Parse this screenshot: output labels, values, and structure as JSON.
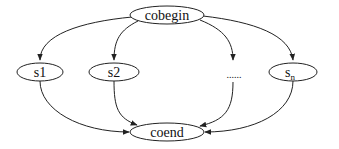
{
  "diagram": {
    "type": "flow",
    "nodes": [
      {
        "id": "cobegin",
        "label": "cobegin"
      },
      {
        "id": "s1",
        "label": "s1"
      },
      {
        "id": "s2",
        "label": "s2"
      },
      {
        "id": "ellipsis",
        "label": "......"
      },
      {
        "id": "sn",
        "label": "s",
        "subscript": "n"
      },
      {
        "id": "coend",
        "label": "coend"
      }
    ],
    "edges": [
      {
        "from": "cobegin",
        "to": "s1"
      },
      {
        "from": "cobegin",
        "to": "s2"
      },
      {
        "from": "cobegin",
        "to": "ellipsis"
      },
      {
        "from": "cobegin",
        "to": "sn"
      },
      {
        "from": "s1",
        "to": "coend"
      },
      {
        "from": "s2",
        "to": "coend"
      },
      {
        "from": "ellipsis",
        "to": "coend"
      },
      {
        "from": "sn",
        "to": "coend"
      }
    ]
  }
}
